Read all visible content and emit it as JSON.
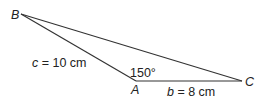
{
  "diagram": {
    "type": "triangle",
    "vertices": {
      "A": {
        "label": "A",
        "x": 136,
        "y": 81
      },
      "B": {
        "label": "B",
        "x": 21,
        "y": 14
      },
      "C": {
        "label": "C",
        "x": 242,
        "y": 81
      }
    },
    "angle_A": {
      "text": "150°"
    },
    "side_c": {
      "var": "c",
      "rest": " = 10 cm"
    },
    "side_b": {
      "var": "b",
      "rest": " = 8 cm"
    },
    "colors": {
      "line": "#333333",
      "text": "#222222"
    }
  }
}
